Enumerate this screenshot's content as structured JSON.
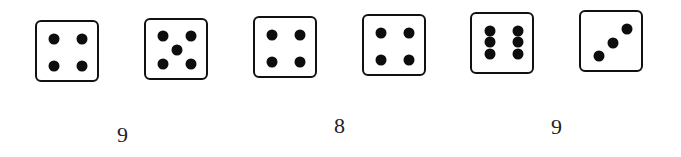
{
  "colors": {
    "background": "#ffffff",
    "die_border": "#111111",
    "pip": "#0d0d0d",
    "text": "#222222"
  },
  "dice": [
    {
      "value": 4,
      "x": 35,
      "y": 20,
      "pips": [
        [
          17,
          17
        ],
        [
          45,
          17
        ],
        [
          17,
          44
        ],
        [
          45,
          44
        ]
      ]
    },
    {
      "value": 5,
      "x": 144,
      "y": 18,
      "pips": [
        [
          17,
          16
        ],
        [
          45,
          16
        ],
        [
          31,
          30
        ],
        [
          17,
          44
        ],
        [
          45,
          44
        ]
      ]
    },
    {
      "value": 4,
      "x": 253,
      "y": 16,
      "pips": [
        [
          17,
          17
        ],
        [
          45,
          17
        ],
        [
          17,
          44
        ],
        [
          45,
          44
        ]
      ]
    },
    {
      "value": 4,
      "x": 362,
      "y": 14,
      "pips": [
        [
          17,
          17
        ],
        [
          45,
          17
        ],
        [
          17,
          44
        ],
        [
          45,
          44
        ]
      ]
    },
    {
      "value": 6,
      "x": 470,
      "y": 12,
      "pips": [
        [
          18,
          17
        ],
        [
          46,
          17
        ],
        [
          18,
          28
        ],
        [
          46,
          28
        ],
        [
          18,
          40
        ],
        [
          46,
          40
        ]
      ]
    },
    {
      "value": 3,
      "x": 579,
      "y": 10,
      "pips": [
        [
          18,
          44
        ],
        [
          32,
          31
        ],
        [
          46,
          17
        ]
      ]
    }
  ],
  "sums": [
    {
      "label": "9",
      "x": 117,
      "y": 124
    },
    {
      "label": "8",
      "x": 334,
      "y": 115
    },
    {
      "label": "9",
      "x": 551,
      "y": 116
    }
  ]
}
